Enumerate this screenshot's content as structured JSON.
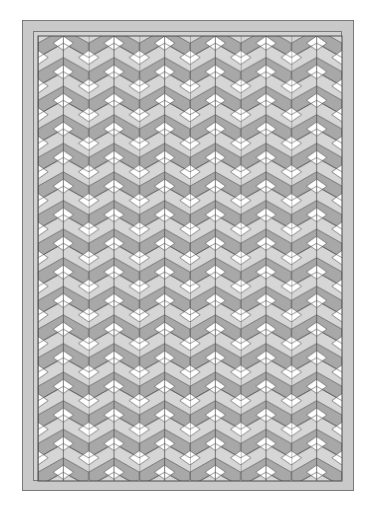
{
  "image": {
    "description": "Quilt pattern of tumbling chevron blocks with white diamonds, in grayscale, framed by a double border",
    "width": 375,
    "height": 512
  },
  "quilt": {
    "outer_border": {
      "x": 22,
      "y": 20,
      "width": 332,
      "height": 471
    },
    "inner_border": {
      "x": 33,
      "y": 31,
      "width": 309,
      "height": 450
    },
    "field": {
      "x": 38,
      "y": 36,
      "width": 304,
      "height": 445
    },
    "tile": {
      "width": 50.67,
      "height": 28.6
    },
    "columns": 6,
    "colors": {
      "border_band": "#c9c9c9",
      "border_line": "#7a7a7a",
      "dark_gray": "#a8a8a8",
      "light_gray": "#d6d6d6",
      "white": "#ffffff",
      "seam": "#4a4a4a"
    }
  }
}
